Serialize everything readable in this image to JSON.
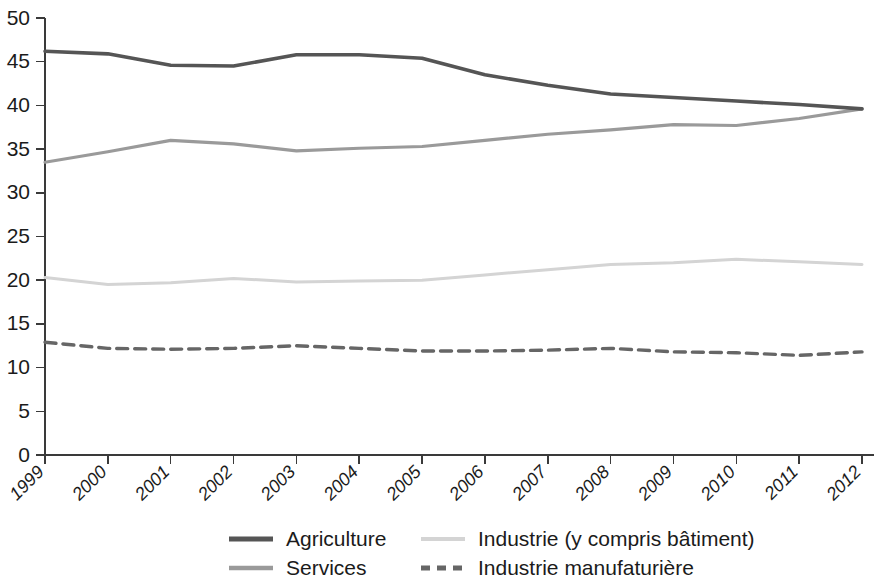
{
  "chart_data": {
    "type": "line",
    "title": "",
    "subtitle": "",
    "xlabel": "",
    "ylabel": "",
    "x": [
      1999,
      2000,
      2001,
      2002,
      2003,
      2004,
      2005,
      2006,
      2007,
      2008,
      2009,
      2010,
      2011,
      2012
    ],
    "categories": [
      "1999",
      "2000",
      "2001",
      "2002",
      "2003",
      "2004",
      "2005",
      "2006",
      "2007",
      "2008",
      "2009",
      "2010",
      "2011",
      "2012"
    ],
    "xlim": [
      1999,
      2012
    ],
    "ylim": [
      0,
      50
    ],
    "yticks": [
      0,
      5,
      10,
      15,
      20,
      25,
      30,
      35,
      40,
      45,
      50
    ],
    "ytick_labels": [
      "0",
      "5",
      "10",
      "15",
      "20",
      "25",
      "30",
      "35",
      "40",
      "45",
      "50"
    ],
    "grid": false,
    "legend_position": "bottom",
    "series": [
      {
        "name": "Agriculture",
        "color": "#555555",
        "style": "solid",
        "width": 3.6,
        "values": [
          46.2,
          45.9,
          44.6,
          44.5,
          45.8,
          45.8,
          45.4,
          43.5,
          42.3,
          41.3,
          40.9,
          40.5,
          40.1,
          39.6
        ]
      },
      {
        "name": "Services",
        "color": "#9a9a9a",
        "style": "solid",
        "width": 3.2,
        "values": [
          33.5,
          34.7,
          36.0,
          35.6,
          34.8,
          35.1,
          35.3,
          36.0,
          36.7,
          37.2,
          37.8,
          37.7,
          38.5,
          39.6
        ]
      },
      {
        "name": "Industrie (y compris bâtiment)",
        "color": "#d4d4d4",
        "style": "solid",
        "width": 3.0,
        "values": [
          20.3,
          19.5,
          19.7,
          20.2,
          19.8,
          19.9,
          20.0,
          20.6,
          21.2,
          21.8,
          22.0,
          22.4,
          22.1,
          21.8
        ]
      },
      {
        "name": "Industrie manufaturière",
        "color": "#666666",
        "style": "dashed",
        "width": 3.4,
        "values": [
          12.9,
          12.2,
          12.1,
          12.2,
          12.5,
          12.2,
          11.9,
          11.9,
          12.0,
          12.2,
          11.8,
          11.7,
          11.4,
          11.8
        ]
      }
    ]
  },
  "axis": {
    "y_labels": [
      "50",
      "45",
      "40",
      "35",
      "30",
      "25",
      "20",
      "15",
      "10",
      "5",
      "0"
    ],
    "x_labels": [
      "1999",
      "2000",
      "2001",
      "2002",
      "2003",
      "2004",
      "2005",
      "2006",
      "2007",
      "2008",
      "2009",
      "2010",
      "2011",
      "2012"
    ]
  },
  "legend": {
    "items": [
      {
        "label": "Agriculture",
        "color": "#555555",
        "style": "solid"
      },
      {
        "label": "Industrie (y compris bâtiment)",
        "color": "#d4d4d4",
        "style": "solid"
      },
      {
        "label": "Services",
        "color": "#9a9a9a",
        "style": "solid"
      },
      {
        "label": "Industrie manufaturière",
        "color": "#666666",
        "style": "dashed"
      }
    ]
  }
}
